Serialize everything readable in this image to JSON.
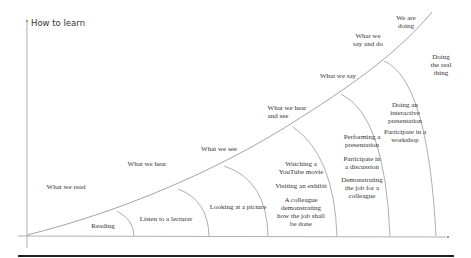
{
  "title": "How to learn",
  "colors": {
    "line": "#9a9a9a",
    "text": "#333333",
    "rule": "#222222"
  },
  "curve_labels": [
    {
      "text": "What we read",
      "x": 66,
      "y": 187
    },
    {
      "text": "What we hear",
      "x": 147,
      "y": 163
    },
    {
      "text": "What we see",
      "x": 219,
      "y": 147
    },
    {
      "text": "What we hear\nand see",
      "x": 287,
      "y": 106
    },
    {
      "text": "What we say",
      "x": 340,
      "y": 73
    },
    {
      "text": "What we\nsay and do",
      "x": 368,
      "y": 32
    },
    {
      "text": "We are\ndoing",
      "x": 404,
      "y": 15
    }
  ],
  "segments": [
    {
      "name": "reading",
      "text": "Reading",
      "x": 102,
      "y": 224
    },
    {
      "name": "lecture",
      "text": "Listen to a lecturer",
      "x": 166,
      "y": 217
    },
    {
      "name": "picture",
      "text": "Looking at a picture",
      "x": 238,
      "y": 204
    },
    {
      "name": "watching",
      "text": "Watching a\nYouTube movie",
      "x": 300,
      "y": 160
    },
    {
      "name": "exhibit",
      "text": "Visiting an exhibit",
      "x": 300,
      "y": 183
    },
    {
      "name": "colleague-demo",
      "text": "A colleague\ndemonstrating\nhow the job shall\nbe done",
      "x": 300,
      "y": 196
    },
    {
      "name": "presentation",
      "text": "Performing a\npresentation",
      "x": 360,
      "y": 133
    },
    {
      "name": "discussion",
      "text": "Participate in\na discussion",
      "x": 360,
      "y": 154
    },
    {
      "name": "demonstrating",
      "text": "Demonstrating\nthe job for a\ncolleague",
      "x": 360,
      "y": 175
    },
    {
      "name": "interactive",
      "text": "Doing an\ninteractive\npresentation",
      "x": 403,
      "y": 99
    },
    {
      "name": "workshop",
      "text": "Participate in a\nworkshop",
      "x": 403,
      "y": 127
    },
    {
      "name": "real-thing",
      "text": "Doing\nthe real\nthing",
      "x": 441,
      "y": 50
    }
  ]
}
